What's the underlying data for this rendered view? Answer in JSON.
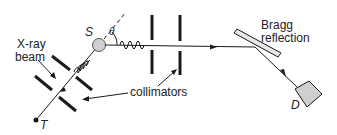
{
  "diagram": {
    "labels": {
      "xray_beam_line1": "X-ray",
      "xray_beam_line2": "beam",
      "scatterer": "S",
      "angle": "θ",
      "bragg_line1": "Bragg",
      "bragg_line2": "reflection",
      "collimators": "collimators",
      "detector": "D",
      "target": "T"
    },
    "colors": {
      "line": "#1a1a1a",
      "fill_gray": "#cfcfcf",
      "text": "#222222"
    }
  }
}
